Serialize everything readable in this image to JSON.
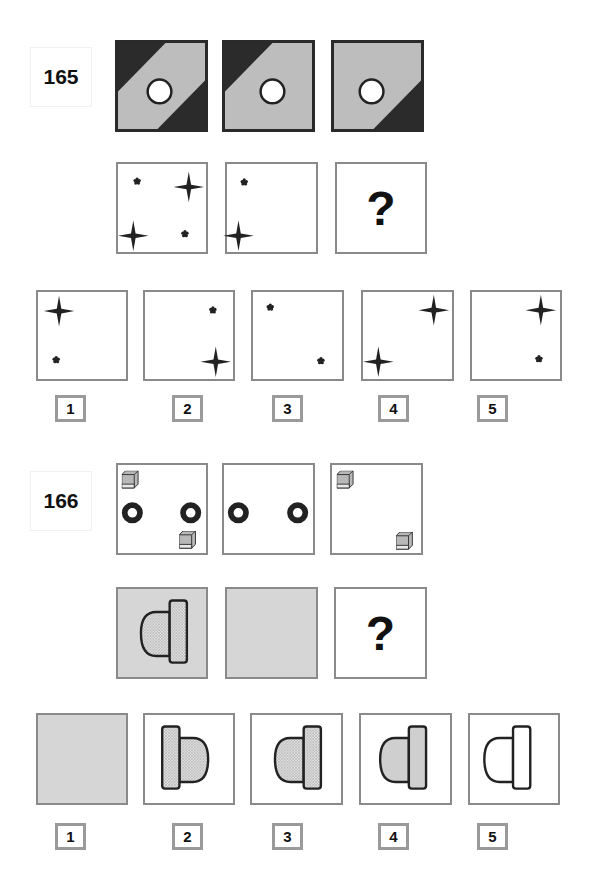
{
  "puzzles": [
    {
      "number": "165",
      "sequence_rows": [
        {
          "cells": [
            "diagonal-band-both-corners-dark",
            "diagonal-band-top-left-dark",
            "diagonal-band-bottom-right-dark"
          ]
        },
        {
          "cells": [
            "two-stars-two-asterisks",
            "one-asterisk-one-star-left",
            "question"
          ]
        }
      ],
      "question_mark": "?",
      "options": [
        {
          "label": "1",
          "content": "star top-left, asterisk bottom-left"
        },
        {
          "label": "2",
          "content": "asterisk top-right, star bottom-right"
        },
        {
          "label": "3",
          "content": "asterisk top-left, asterisk bottom-right"
        },
        {
          "label": "4",
          "content": "star top-right, star bottom-left"
        },
        {
          "label": "5",
          "content": "star top-right, asterisk bottom-right"
        }
      ]
    },
    {
      "number": "166",
      "sequence_rows": [
        {
          "cells": [
            "cubes-and-rings",
            "rings-only",
            "cubes-only"
          ]
        },
        {
          "cells": [
            "grey-with-dotted-dome-bar",
            "grey-empty",
            "question"
          ]
        }
      ],
      "question_mark": "?",
      "options": [
        {
          "label": "1",
          "content": "grey empty square"
        },
        {
          "label": "2",
          "content": "dotted bar left, dome right"
        },
        {
          "label": "3",
          "content": "dotted dome left, bar right"
        },
        {
          "label": "4",
          "content": "grey dome left, grey bar right"
        },
        {
          "label": "5",
          "content": "white dome left, white bar right"
        }
      ]
    }
  ],
  "colors": {
    "dark_fill": "#2b2b2b",
    "light_grey_fill": "#bdbdbd",
    "panel_grey": "#d6d6d6",
    "border_grey": "#8a8a8a"
  }
}
